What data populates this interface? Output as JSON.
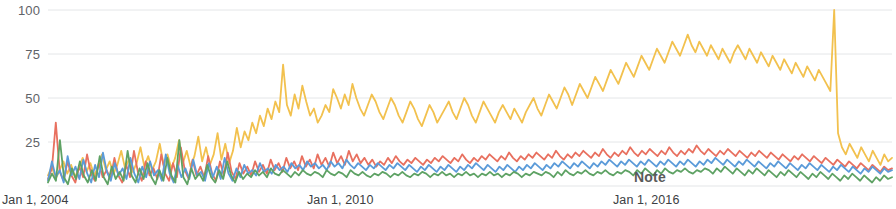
{
  "chart_data": {
    "type": "line",
    "title": "",
    "subtitle": "",
    "xlabel": "",
    "ylabel": "",
    "ylim": [
      0,
      100
    ],
    "grid": true,
    "legend_position": "none",
    "y_ticks": [
      100,
      75,
      50,
      25
    ],
    "y_tick_labels": [
      "100",
      "75",
      "50",
      "25"
    ],
    "x_ticks": [
      "Jan 1, 2004",
      "Jan 1, 2010",
      "Jan 1, 2016"
    ],
    "x_tick_positions": [
      0,
      72,
      144
    ],
    "x_range": [
      0,
      215
    ],
    "annotations": [
      {
        "text": "Note",
        "x": 152,
        "y": 9
      }
    ],
    "colors": {
      "series_1": "#e8705f",
      "series_2": "#5b9bd9",
      "series_3": "#5ea264",
      "series_4": "#f2c14e",
      "grid": "#e4e6e8",
      "axis_text": "#5f6368",
      "background": "#ffffff"
    },
    "series": [
      {
        "name": "series_4",
        "color": "#f2c14e",
        "values": [
          6,
          11,
          4,
          9,
          14,
          7,
          12,
          5,
          10,
          16,
          8,
          13,
          6,
          11,
          18,
          9,
          14,
          7,
          12,
          20,
          10,
          15,
          8,
          13,
          22,
          11,
          17,
          9,
          14,
          24,
          12,
          18,
          10,
          16,
          26,
          13,
          20,
          11,
          17,
          28,
          14,
          22,
          12,
          18,
          30,
          15,
          24,
          13,
          20,
          33,
          22,
          31,
          26,
          36,
          30,
          40,
          34,
          44,
          38,
          48,
          42,
          69,
          46,
          40,
          52,
          44,
          57,
          48,
          40,
          44,
          36,
          40,
          46,
          42,
          55,
          50,
          44,
          52,
          46,
          58,
          50,
          44,
          40,
          46,
          52,
          48,
          42,
          38,
          44,
          50,
          46,
          40,
          36,
          42,
          48,
          44,
          38,
          34,
          40,
          46,
          42,
          36,
          40,
          44,
          48,
          42,
          38,
          44,
          50,
          46,
          40,
          36,
          42,
          48,
          44,
          40,
          36,
          42,
          46,
          42,
          38,
          44,
          40,
          36,
          42,
          46,
          50,
          44,
          40,
          46,
          52,
          48,
          44,
          50,
          56,
          52,
          46,
          52,
          58,
          54,
          50,
          56,
          62,
          58,
          54,
          60,
          66,
          62,
          58,
          64,
          70,
          66,
          62,
          68,
          74,
          70,
          66,
          72,
          78,
          74,
          70,
          76,
          82,
          78,
          74,
          80,
          86,
          80,
          76,
          82,
          78,
          74,
          80,
          76,
          72,
          78,
          74,
          70,
          76,
          80,
          76,
          72,
          78,
          74,
          70,
          76,
          72,
          68,
          74,
          70,
          66,
          72,
          68,
          64,
          70,
          66,
          62,
          68,
          64,
          60,
          66,
          62,
          58,
          54,
          100,
          30,
          22,
          18,
          24,
          20,
          16,
          22,
          18,
          14,
          20,
          16,
          12,
          18,
          14,
          16
        ]
      },
      {
        "name": "series_1",
        "color": "#e8705f",
        "values": [
          4,
          10,
          36,
          8,
          3,
          14,
          6,
          2,
          11,
          5,
          18,
          7,
          3,
          13,
          5,
          9,
          4,
          16,
          6,
          2,
          12,
          5,
          20,
          8,
          3,
          14,
          6,
          10,
          4,
          18,
          7,
          3,
          13,
          5,
          22,
          9,
          4,
          15,
          6,
          11,
          5,
          17,
          7,
          3,
          14,
          6,
          19,
          8,
          4,
          13,
          7,
          11,
          6,
          14,
          8,
          12,
          7,
          15,
          9,
          13,
          8,
          16,
          10,
          14,
          9,
          17,
          11,
          15,
          10,
          18,
          12,
          16,
          11,
          19,
          13,
          17,
          12,
          20,
          14,
          18,
          13,
          16,
          12,
          15,
          11,
          14,
          12,
          16,
          13,
          17,
          14,
          12,
          15,
          13,
          16,
          14,
          12,
          15,
          13,
          16,
          14,
          17,
          15,
          13,
          16,
          14,
          18,
          15,
          13,
          16,
          14,
          17,
          15,
          18,
          16,
          14,
          17,
          15,
          19,
          16,
          14,
          17,
          15,
          18,
          16,
          19,
          17,
          15,
          18,
          16,
          20,
          17,
          15,
          18,
          16,
          19,
          17,
          20,
          18,
          16,
          19,
          17,
          21,
          18,
          16,
          19,
          17,
          20,
          18,
          22,
          19,
          17,
          20,
          18,
          21,
          19,
          17,
          20,
          18,
          22,
          19,
          17,
          20,
          18,
          21,
          19,
          23,
          20,
          18,
          21,
          19,
          17,
          20,
          18,
          21,
          19,
          17,
          20,
          18,
          16,
          19,
          17,
          20,
          18,
          16,
          19,
          17,
          15,
          18,
          16,
          14,
          17,
          15,
          18,
          16,
          14,
          17,
          15,
          13,
          16,
          14,
          12,
          15,
          13,
          11,
          14,
          12,
          10,
          13,
          11,
          9,
          12,
          10,
          8,
          11,
          9,
          10
        ]
      },
      {
        "name": "series_2",
        "color": "#5b9bd9",
        "values": [
          3,
          14,
          5,
          9,
          2,
          17,
          6,
          11,
          4,
          15,
          7,
          2,
          12,
          5,
          19,
          8,
          3,
          13,
          6,
          10,
          4,
          16,
          7,
          2,
          11,
          5,
          14,
          6,
          9,
          3,
          18,
          7,
          2,
          12,
          5,
          10,
          4,
          15,
          6,
          8,
          3,
          13,
          5,
          11,
          4,
          16,
          7,
          3,
          10,
          5,
          12,
          7,
          9,
          6,
          13,
          8,
          10,
          7,
          12,
          9,
          11,
          8,
          13,
          10,
          12,
          9,
          14,
          11,
          13,
          10,
          12,
          9,
          14,
          11,
          13,
          10,
          15,
          12,
          10,
          13,
          11,
          9,
          12,
          10,
          13,
          11,
          9,
          12,
          10,
          13,
          11,
          9,
          12,
          10,
          8,
          11,
          9,
          12,
          10,
          8,
          11,
          9,
          12,
          10,
          8,
          11,
          9,
          12,
          10,
          13,
          11,
          9,
          12,
          10,
          8,
          11,
          9,
          12,
          10,
          8,
          11,
          9,
          12,
          10,
          13,
          11,
          9,
          12,
          10,
          13,
          11,
          14,
          12,
          10,
          13,
          11,
          14,
          12,
          10,
          13,
          11,
          14,
          12,
          15,
          13,
          11,
          14,
          12,
          15,
          13,
          11,
          14,
          12,
          15,
          13,
          11,
          14,
          12,
          15,
          13,
          11,
          14,
          12,
          15,
          13,
          11,
          14,
          12,
          15,
          13,
          16,
          14,
          12,
          15,
          13,
          11,
          14,
          12,
          15,
          13,
          11,
          14,
          12,
          10,
          13,
          11,
          14,
          12,
          10,
          13,
          11,
          9,
          12,
          10,
          13,
          11,
          9,
          12,
          10,
          8,
          11,
          9,
          12,
          10,
          8,
          11,
          9,
          7,
          10,
          8,
          11,
          9,
          7,
          10,
          8,
          9
        ]
      },
      {
        "name": "series_3",
        "color": "#5ea264",
        "values": [
          2,
          7,
          3,
          26,
          5,
          1,
          10,
          4,
          14,
          6,
          2,
          9,
          3,
          17,
          5,
          1,
          11,
          4,
          8,
          3,
          20,
          6,
          2,
          10,
          4,
          13,
          5,
          1,
          9,
          3,
          16,
          6,
          2,
          26,
          5,
          1,
          10,
          4,
          7,
          3,
          12,
          5,
          2,
          9,
          4,
          14,
          6,
          2,
          8,
          4,
          7,
          5,
          9,
          6,
          8,
          5,
          10,
          7,
          6,
          9,
          7,
          5,
          8,
          6,
          9,
          7,
          6,
          8,
          7,
          5,
          9,
          7,
          6,
          8,
          7,
          5,
          9,
          7,
          6,
          8,
          6,
          5,
          7,
          6,
          8,
          7,
          5,
          7,
          6,
          8,
          6,
          5,
          7,
          6,
          8,
          7,
          5,
          7,
          6,
          8,
          6,
          7,
          5,
          7,
          6,
          8,
          6,
          7,
          5,
          7,
          6,
          8,
          6,
          7,
          5,
          7,
          6,
          8,
          7,
          5,
          7,
          6,
          8,
          7,
          6,
          8,
          7,
          5,
          8,
          6,
          9,
          7,
          6,
          8,
          7,
          9,
          7,
          6,
          8,
          7,
          9,
          7,
          6,
          8,
          7,
          9,
          8,
          6,
          9,
          7,
          10,
          8,
          6,
          9,
          7,
          10,
          8,
          7,
          9,
          8,
          10,
          8,
          7,
          9,
          8,
          10,
          9,
          7,
          10,
          8,
          11,
          9,
          7,
          10,
          8,
          6,
          9,
          7,
          10,
          8,
          6,
          9,
          7,
          5,
          8,
          6,
          9,
          7,
          5,
          8,
          6,
          4,
          7,
          5,
          8,
          6,
          4,
          7,
          5,
          3,
          6,
          4,
          7,
          5,
          3,
          6,
          4,
          2,
          5,
          3,
          6,
          4,
          5
        ]
      }
    ]
  }
}
